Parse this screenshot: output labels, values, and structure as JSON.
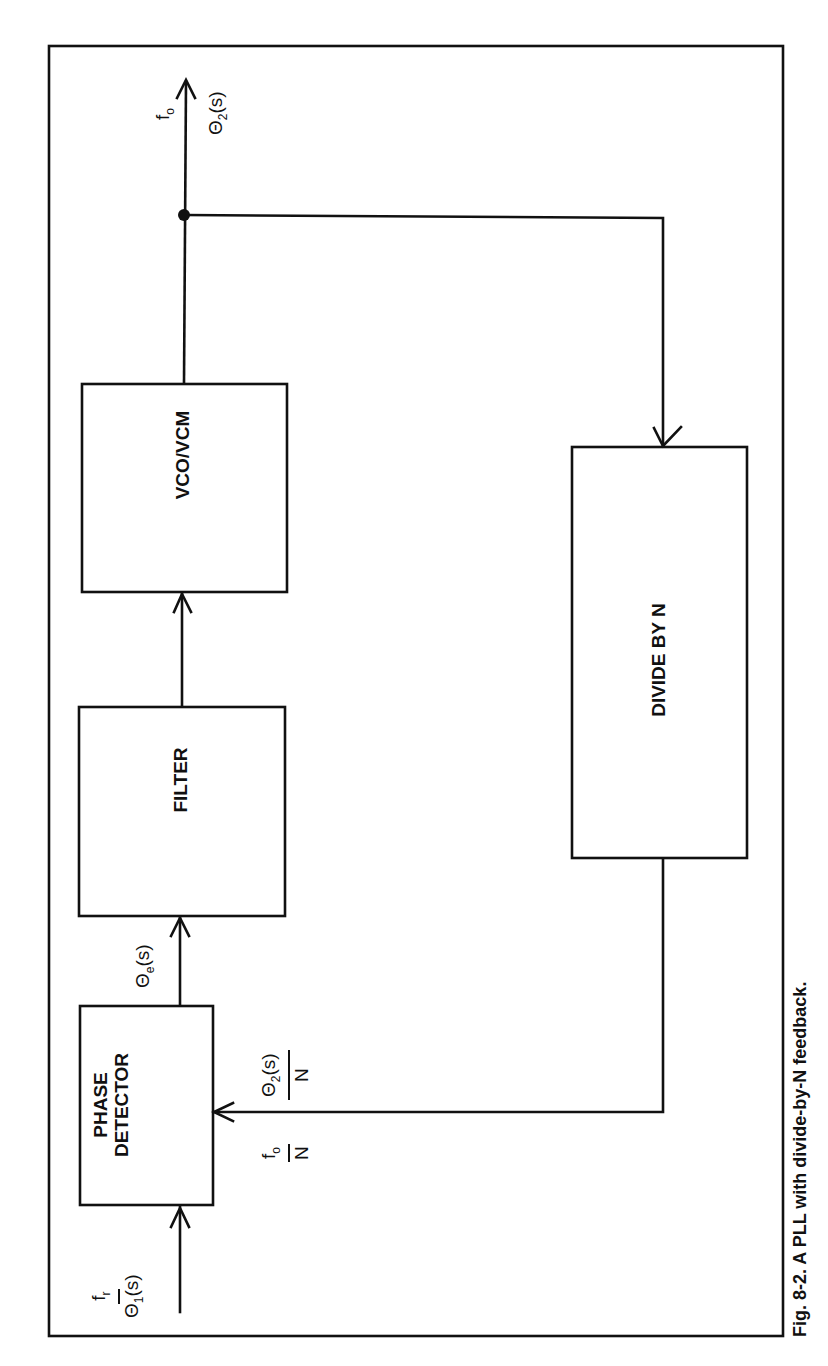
{
  "figure": {
    "caption": "Fig. 8-2. A PLL with divide-by-N feedback."
  },
  "blocks": {
    "phase_detector": [
      "PHASE",
      "DETECTOR"
    ],
    "filter": "FILTER",
    "vco": "VCO/VCM",
    "divider": "DIVIDE BY N"
  },
  "signals": {
    "input": {
      "freq": "f",
      "freq_sub": "r",
      "phase": "Θ",
      "phase_sub": "1",
      "phase_tail": "(s)"
    },
    "error": {
      "phase": "Θ",
      "phase_sub": "e",
      "phase_tail": "(s)"
    },
    "output": {
      "freq": "f",
      "freq_sub": "o",
      "phase": "Θ",
      "phase_sub": "2",
      "phase_tail": "(s)"
    },
    "feedback_freq": {
      "num": "f",
      "num_sub": "o",
      "den": "N"
    },
    "feedback_phase": {
      "num": "Θ",
      "num_sub": "2",
      "num_tail": "(s)",
      "den": "N"
    }
  },
  "colors": {
    "ink": "#111111",
    "paper": "#ffffff"
  }
}
